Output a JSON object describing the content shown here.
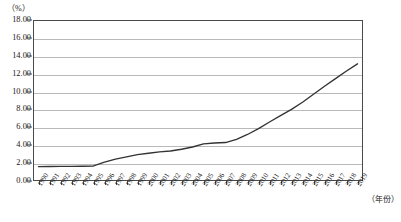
{
  "chart_data": {
    "type": "line",
    "title": "",
    "xlabel": "（年份）",
    "ylabel": "（%）",
    "ylim": [
      0,
      18
    ],
    "yticks": [
      "0.00",
      "2.00",
      "4.00",
      "6.00",
      "8.00",
      "10.00",
      "12.00",
      "14.00",
      "16.00",
      "18.00"
    ],
    "ytick_values": [
      0,
      2,
      4,
      6,
      8,
      10,
      12,
      14,
      16,
      18
    ],
    "grid": true,
    "legend": "none",
    "line_color": "#333333",
    "categories": [
      "1990",
      "1991",
      "1992",
      "1993",
      "1994",
      "1995",
      "1996",
      "1997",
      "1998",
      "1999",
      "2000",
      "2001",
      "2002",
      "2003",
      "2004",
      "2005",
      "2006",
      "2007",
      "2008",
      "2009",
      "2010",
      "2011",
      "2012",
      "2013",
      "2014",
      "2015",
      "2016",
      "2017",
      "2018",
      "2019"
    ],
    "values": [
      1.6,
      1.62,
      1.63,
      1.64,
      1.65,
      1.68,
      2.1,
      2.45,
      2.7,
      2.95,
      3.1,
      3.25,
      3.35,
      3.55,
      3.8,
      4.15,
      4.25,
      4.3,
      4.65,
      5.2,
      5.85,
      6.6,
      7.3,
      8.0,
      8.8,
      9.7,
      10.6,
      11.45,
      12.3,
      13.1
    ],
    "values_note": "percent"
  },
  "axis": {
    "y_unit_label": "（%）",
    "x_unit_label": "（年份）"
  }
}
